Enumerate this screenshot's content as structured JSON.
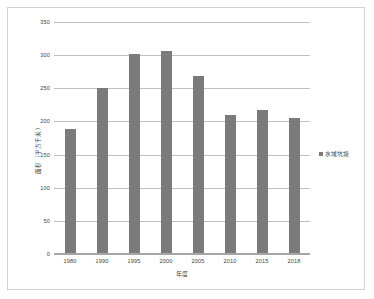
{
  "chart_data": {
    "type": "bar",
    "title": "",
    "subtitle": "",
    "xlabel": "年度",
    "ylabel": "面积（平方千米）",
    "categories": [
      "1980",
      "1990",
      "1995",
      "2000",
      "2005",
      "2010",
      "2015",
      "2018"
    ],
    "values": [
      188,
      251,
      301,
      306,
      268,
      209,
      218,
      205
    ],
    "series": [
      {
        "name": "水域坑塘",
        "values": [
          188,
          251,
          301,
          306,
          268,
          209,
          218,
          205
        ],
        "color": "#7b7b7b"
      }
    ],
    "ylim": [
      0,
      350
    ],
    "yticks": [
      0,
      50,
      100,
      150,
      200,
      250,
      300,
      350
    ],
    "ytick_labels": [
      "0",
      "50",
      "100",
      "150",
      "200",
      "250",
      "300",
      "350"
    ],
    "grid": true,
    "grid_axis": "y",
    "grid_color": "#bfbfbf",
    "legend": {
      "position": "right",
      "entries": [
        {
          "label": "水域坑塘",
          "color": "#7b7b7b",
          "marker": "square-marker"
        }
      ]
    },
    "plot_background": "#ffffff",
    "frame_border_color": "#d4d4d4"
  }
}
